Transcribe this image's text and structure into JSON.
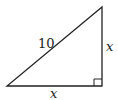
{
  "diagram": {
    "type": "right-triangle",
    "vertices": {
      "top": [
        102,
        7
      ],
      "bottom_left": [
        7,
        86
      ],
      "bottom_right": [
        102,
        86
      ]
    },
    "right_angle_at": "bottom_right",
    "labels": {
      "hypotenuse": "10",
      "vertical_leg": "x",
      "horizontal_leg": "x"
    },
    "colors": {
      "stroke": "#222222",
      "background": "#ffffff"
    }
  }
}
